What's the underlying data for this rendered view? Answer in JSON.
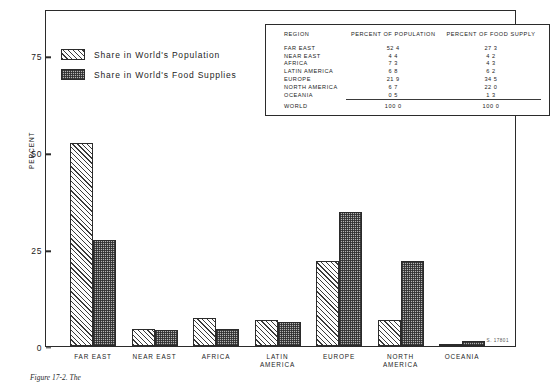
{
  "chart_data": {
    "type": "bar",
    "title": "",
    "xlabel": "",
    "ylabel": "PERCENT",
    "ylim": [
      0,
      87
    ],
    "yticks": [
      "0",
      "25",
      "50",
      "75"
    ],
    "grid": false,
    "legend_position": "upper-left-inside",
    "categories": [
      "FAR EAST",
      "NEAR EAST",
      "AFRICA",
      "LATIN AMERICA",
      "EUROPE",
      "NORTH AMERICA",
      "OCEANIA"
    ],
    "category_lines": [
      [
        "FAR EAST"
      ],
      [
        "NEAR EAST"
      ],
      [
        "AFRICA"
      ],
      [
        "LATIN",
        "AMERICA"
      ],
      [
        "EUROPE"
      ],
      [
        "NORTH",
        "AMERICA"
      ],
      [
        "OCEANIA"
      ]
    ],
    "series": [
      {
        "name": "Share in World's Population",
        "pattern": "diagonal-hatch",
        "values": [
          52.4,
          4.4,
          7.3,
          6.8,
          21.9,
          6.7,
          0.5
        ]
      },
      {
        "name": "Share in World's Food Supplies",
        "pattern": "gray-checker",
        "values": [
          27.3,
          4.2,
          4.3,
          6.2,
          34.5,
          22.0,
          1.3
        ]
      }
    ]
  },
  "legend": {
    "items": [
      {
        "label": "Share in World's Population"
      },
      {
        "label": "Share in World's Food Supplies"
      }
    ]
  },
  "table": {
    "headers": [
      "REGION",
      "PERCENT OF POPULATION",
      "PERCENT OF FOOD SUPPLY"
    ],
    "rows": [
      {
        "region": "FAR EAST",
        "population": "52 4",
        "food": "27 3"
      },
      {
        "region": "NEAR EAST",
        "population": "4 4",
        "food": "4 2"
      },
      {
        "region": "AFRICA",
        "population": "7 3",
        "food": "4 3"
      },
      {
        "region": "LATIN AMERICA",
        "population": "6 8",
        "food": "6 2"
      },
      {
        "region": "EUROPE",
        "population": "21 9",
        "food": "34 5"
      },
      {
        "region": "NORTH AMERICA",
        "population": "6 7",
        "food": "22 0"
      },
      {
        "region": "OCEANIA",
        "population": "0 5",
        "food": "1 3"
      }
    ],
    "total": {
      "region": "WORLD",
      "population": "100 0",
      "food": "100 0"
    }
  },
  "annotations": {
    "plate_note": "S. 17801",
    "caption": "Figure 17-2.  The"
  }
}
